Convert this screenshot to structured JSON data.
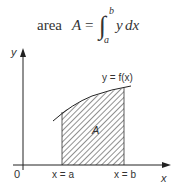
{
  "formula": {
    "prefix": "area",
    "variable": "A",
    "equals": "=",
    "integral": "∫",
    "upper_limit": "b",
    "lower_limit": "a",
    "integrand": "y",
    "differential": "dx"
  },
  "diagram": {
    "y_axis_label": "y",
    "x_axis_label": "x",
    "origin_label": "0",
    "curve_label": "y = f(x)",
    "region_label": "A",
    "left_bound_label": "x = a",
    "right_bound_label": "x = b"
  },
  "colors": {
    "line": "#222222",
    "hatch": "#555555",
    "text": "#333333"
  }
}
